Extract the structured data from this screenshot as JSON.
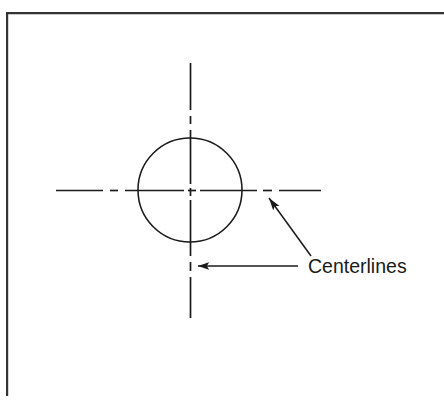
{
  "figure": {
    "domain": "engineering-drawing",
    "background_color": "#ffffff",
    "line_color": "#1a1a1a",
    "frame": {
      "style": "L-shaped rule",
      "top_rule": {
        "x1": 7,
        "y1": 13,
        "x2": 444,
        "y2": 13,
        "width": 2.2
      },
      "left_rule": {
        "x1": 7,
        "y1": 13,
        "x2": 7,
        "y2": 396,
        "width": 2.2
      }
    },
    "circle": {
      "name": "hole-circle",
      "center_x": 190,
      "center_y": 190,
      "radius": 52,
      "stroke_width": 1.5,
      "fill": "none"
    },
    "centerlines": {
      "style": "long dash - short dash (ASME Y14.2 centerline)",
      "stroke_width": 1.6,
      "dash_pattern": "34 5 7 5",
      "horizontal": {
        "x1": 56,
        "y1": 190,
        "x2": 321,
        "y2": 190
      },
      "vertical": {
        "x1": 190,
        "y1": 63,
        "x2": 190,
        "y2": 318
      }
    },
    "leaders": [
      {
        "name": "leader-to-vertical-centerline",
        "type": "horizontal",
        "from_x": 298,
        "from_y": 266,
        "to_x": 192,
        "to_y": 266,
        "arrowhead": "left",
        "stroke_width": 1.5
      },
      {
        "name": "leader-to-horizontal-centerline",
        "type": "diagonal",
        "from_x": 311,
        "from_y": 255,
        "to_x": 265,
        "to_y": 192,
        "arrowhead": "up-left",
        "stroke_width": 1.5
      }
    ],
    "label": {
      "text": "Centerlines",
      "x": 308,
      "y": 273,
      "font_size": "19.5px",
      "color": "#1a1a1a"
    }
  }
}
